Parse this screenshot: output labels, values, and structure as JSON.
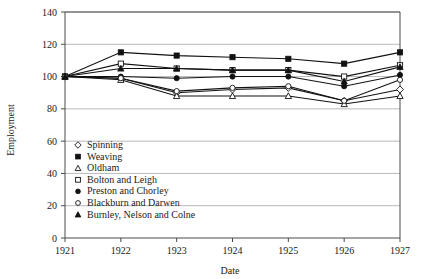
{
  "chart_data": {
    "type": "line",
    "title": "",
    "xlabel": "Date",
    "ylabel": "Employment",
    "x": [
      1921,
      1922,
      1923,
      1924,
      1925,
      1926,
      1927
    ],
    "xtick_labels": [
      "1921",
      "1922",
      "1923",
      "1924",
      "1925",
      "1926",
      "1927"
    ],
    "ytick_labels": [
      "0",
      "20",
      "40",
      "60",
      "80",
      "100",
      "120",
      "140"
    ],
    "ytick_values": [
      0,
      20,
      40,
      60,
      80,
      100,
      120,
      140
    ],
    "ylim": [
      0,
      140
    ],
    "xlim": [
      1921,
      1927
    ],
    "grid": "horizontal",
    "legend_position": "inside-lower-left",
    "series": [
      {
        "name": "Spinning",
        "marker": "diamond-open",
        "values": [
          100,
          99,
          90,
          92,
          93,
          85,
          92
        ]
      },
      {
        "name": "Weaving",
        "marker": "square-filled",
        "values": [
          100,
          115,
          113,
          112,
          111,
          108,
          115
        ]
      },
      {
        "name": "Oldham",
        "marker": "triangle-open",
        "values": [
          100,
          98,
          88,
          88,
          88,
          83,
          88
        ]
      },
      {
        "name": "Bolton and Leigh",
        "marker": "square-open",
        "values": [
          100,
          108,
          105,
          104,
          104,
          100,
          107
        ]
      },
      {
        "name": "Preston and Chorley",
        "marker": "circle-filled",
        "values": [
          100,
          100,
          99,
          100,
          100,
          94,
          101
        ]
      },
      {
        "name": "Blackburn and Darwen",
        "marker": "circle-open",
        "values": [
          100,
          99,
          91,
          93,
          94,
          85,
          98
        ]
      },
      {
        "name": "Burnley, Nelson and Colne",
        "marker": "triangle-filled",
        "values": [
          100,
          105,
          105,
          104,
          104,
          97,
          106
        ]
      }
    ]
  },
  "legend": {
    "items": [
      {
        "label": "Spinning",
        "marker": "diamond-open"
      },
      {
        "label": "Weaving",
        "marker": "square-filled"
      },
      {
        "label": "Oldham",
        "marker": "triangle-open"
      },
      {
        "label": "Bolton and Leigh",
        "marker": "square-open"
      },
      {
        "label": "Preston and Chorley",
        "marker": "circle-filled"
      },
      {
        "label": "Blackburn and Darwen",
        "marker": "circle-open"
      },
      {
        "label": "Burnley, Nelson and Colne",
        "marker": "triangle-filled"
      }
    ]
  },
  "colors": {
    "ink": "#111111",
    "grid": "#9a9a9a",
    "axis": "#4a4a4a",
    "background": "#ffffff"
  }
}
